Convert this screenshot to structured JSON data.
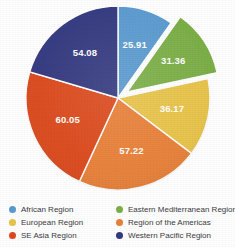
{
  "chart_data": {
    "type": "pie",
    "title": "",
    "subtitle": "",
    "total": 264.79,
    "legend_position": "bottom",
    "grid": false,
    "start_angle_deg": 0,
    "direction": "clockwise",
    "categories": [
      "African Region",
      "Eastern Mediterranean Region",
      "European Region",
      "Region of the Americas",
      "SE Asia Region",
      "Western Pacific Region"
    ],
    "values": [
      25.91,
      31.36,
      36.17,
      57.22,
      60.05,
      54.08
    ],
    "colors": [
      "#5b9bd0",
      "#7caf48",
      "#e8c44a",
      "#e8813a",
      "#dc4b1e",
      "#343a80"
    ],
    "exploded": [
      "Eastern Mediterranean Region"
    ],
    "slices": [
      {
        "label": "African Region",
        "value": "25.91",
        "color": "#5b9bd0",
        "exploded": false
      },
      {
        "label": "Eastern Mediterranean Region",
        "value": "31.36",
        "color": "#7caf48",
        "exploded": true
      },
      {
        "label": "European Region",
        "value": "36.17",
        "color": "#e8c44a",
        "exploded": false
      },
      {
        "label": "Region of the Americas",
        "value": "57.22",
        "color": "#e8813a",
        "exploded": false
      },
      {
        "label": "SE Asia Region",
        "value": "60.05",
        "color": "#dc4b1e",
        "exploded": false
      },
      {
        "label": "Western Pacific Region",
        "value": "54.08",
        "color": "#343a80",
        "exploded": false
      }
    ]
  },
  "legend": {
    "items": [
      {
        "label": "African Region",
        "color": "#5b9bd0"
      },
      {
        "label": "Eastern Mediterranean Region",
        "color": "#7caf48"
      },
      {
        "label": "European Region",
        "color": "#e8c44a"
      },
      {
        "label": "Region of the Americas",
        "color": "#e8813a"
      },
      {
        "label": "SE Asia Region",
        "color": "#dc4b1e"
      },
      {
        "label": "Western Pacific Region",
        "color": "#343a80"
      }
    ]
  }
}
